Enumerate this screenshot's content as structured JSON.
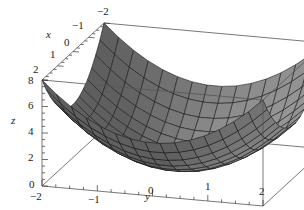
{
  "chart_data": {
    "type": "surface3d",
    "function": "z = x^2 + y^2",
    "title": "",
    "xlabel": "x",
    "ylabel": "y",
    "zlabel": "z",
    "x_range": [
      -2,
      2
    ],
    "y_range": [
      -2,
      2
    ],
    "z_range": [
      0,
      8
    ],
    "x_ticks": [
      "-2",
      "-1",
      "0",
      "1",
      "2"
    ],
    "y_ticks": [
      "-2",
      "-1",
      "0",
      "1",
      "2"
    ],
    "z_ticks": [
      "0",
      "2",
      "4",
      "6",
      "8"
    ],
    "grid_lines": 15,
    "surface_color": "#8a8a8a",
    "mesh_color": "#1a1a1a",
    "box_color": "#555555",
    "samples": [
      {
        "x": -2,
        "y": -2,
        "z": 8
      },
      {
        "x": -2,
        "y": 0,
        "z": 4
      },
      {
        "x": -2,
        "y": 2,
        "z": 8
      },
      {
        "x": 0,
        "y": -2,
        "z": 4
      },
      {
        "x": 0,
        "y": 0,
        "z": 0
      },
      {
        "x": 0,
        "y": 2,
        "z": 4
      },
      {
        "x": 2,
        "y": -2,
        "z": 8
      },
      {
        "x": 2,
        "y": 0,
        "z": 4
      },
      {
        "x": 2,
        "y": 2,
        "z": 8
      }
    ]
  },
  "labels": {
    "x_axis": "x",
    "y_axis": "y",
    "z_axis": "z",
    "x_tick_neg2": "−2",
    "x_tick_neg1": "−1",
    "x_tick_0": "0",
    "x_tick_1": "1",
    "x_tick_2": "2",
    "y_tick_neg2": "−2",
    "y_tick_neg1": "−1",
    "y_tick_0": "0",
    "y_tick_1": "1",
    "y_tick_2": "2",
    "z_tick_0": "0",
    "z_tick_2": "2",
    "z_tick_4": "4",
    "z_tick_6": "6",
    "z_tick_8": "8"
  }
}
